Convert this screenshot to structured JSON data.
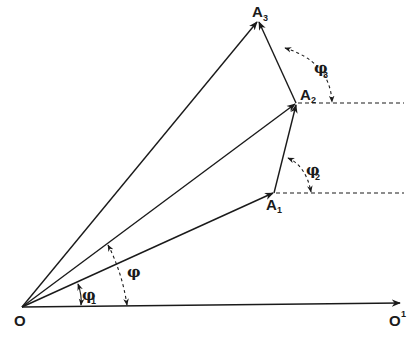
{
  "diagram": {
    "type": "vector-addition-phasor-diagram",
    "stroke_color": "#1a1a1a",
    "background": "#ffffff",
    "points": {
      "O": {
        "label": "O",
        "x": 22,
        "y": 307
      },
      "O1": {
        "label": "O",
        "sup": "1",
        "x": 400,
        "y": 303
      },
      "A1": {
        "label": "A",
        "sub": "1",
        "x": 274,
        "y": 193
      },
      "A2": {
        "label": "A",
        "sub": "2",
        "x": 296,
        "y": 103
      },
      "A3": {
        "label": "A",
        "sub": "3",
        "x": 258,
        "y": 20
      }
    },
    "vectors": [
      {
        "id": "O-O1",
        "from": "O",
        "to": "O1",
        "style": "solid",
        "arrow": true
      },
      {
        "id": "O-A1",
        "from": "O",
        "to": "A1",
        "style": "solid",
        "arrow": true
      },
      {
        "id": "O-A2",
        "from": "O",
        "to": "A2",
        "style": "solid",
        "arrow": true
      },
      {
        "id": "O-A3",
        "from": "O",
        "to": "A3",
        "style": "solid",
        "arrow": true
      },
      {
        "id": "A1-A2",
        "from": "A1",
        "to": "A2",
        "style": "solid",
        "arrow": true
      },
      {
        "id": "A2-A3",
        "from": "A2",
        "to": "A3",
        "style": "solid",
        "arrow": true
      }
    ],
    "reference_lines": [
      {
        "id": "h-A1",
        "from": "A1",
        "to_x": 403,
        "style": "dashed"
      },
      {
        "id": "h-A2",
        "from": "A2",
        "to_x": 403,
        "style": "dashed"
      }
    ],
    "angles": [
      {
        "id": "phi",
        "label": "φ",
        "sub": "",
        "between": [
          "O-O1",
          "O-A2"
        ]
      },
      {
        "id": "phi1",
        "label": "φ",
        "sub": "1",
        "between": [
          "O-O1",
          "O-A1"
        ]
      },
      {
        "id": "phi2",
        "label": "φ",
        "sub": "2",
        "between": [
          "h-A1",
          "A1-A2"
        ]
      },
      {
        "id": "phi3",
        "label": "φ",
        "sub": "3",
        "between": [
          "h-A2",
          "A2-A3"
        ]
      }
    ]
  },
  "labels": {
    "O": "O",
    "O1_main": "O",
    "O1_sup": "1",
    "A1_main": "A",
    "A1_sub": "1",
    "A2_main": "A",
    "A2_sub": "2",
    "A3_main": "A",
    "A3_sub": "3",
    "phi": "φ",
    "phi1_main": "φ",
    "phi1_sub": "1",
    "phi2_main": "φ",
    "phi2_sub": "2",
    "phi3_main": "φ",
    "phi3_sub": "3"
  }
}
